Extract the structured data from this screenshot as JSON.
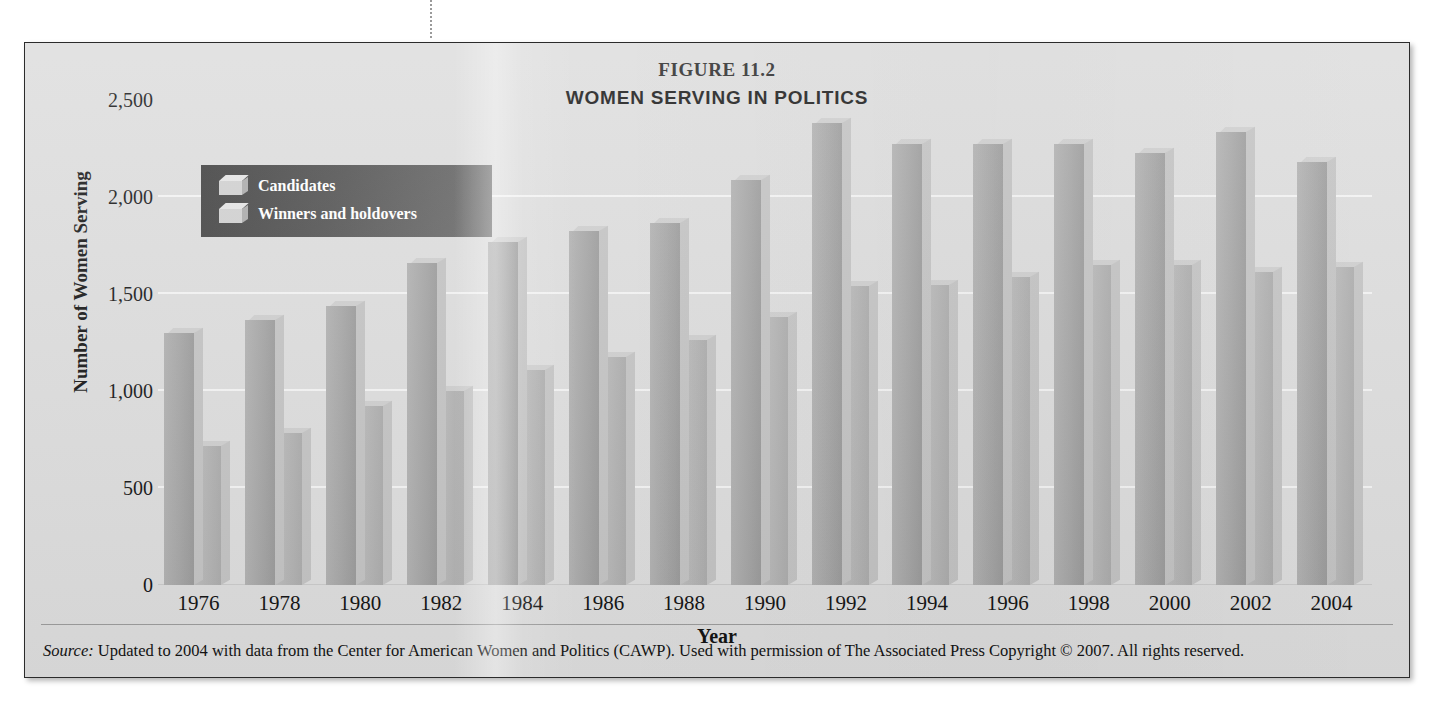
{
  "figure": {
    "number": "FIGURE 11.2",
    "title": "WOMEN SERVING IN POLITICS",
    "source_word": "Source:",
    "source_text": " Updated to 2004 with data from the Center for American Women and Politics (CAWP). Used with permission of The Associated Press Copyright © 2007. All rights reserved."
  },
  "legend": {
    "items": [
      {
        "label": "Candidates"
      },
      {
        "label": "Winners and holdovers"
      }
    ]
  },
  "colors": {
    "panel_background": "#dcdcdc",
    "panel_border": "#2b2b2b",
    "gridline": "#f3f3f3",
    "candidates_bar": "#a4a4a4",
    "winners_bar": "#b3b3b3",
    "legend_background": "#4d4d4d",
    "legend_text": "#ffffff",
    "text": "#111111"
  },
  "chart_data": {
    "type": "bar",
    "title": "WOMEN SERVING IN POLITICS",
    "subtitle": "FIGURE 11.2",
    "xlabel": "Year",
    "ylabel": "Number of Women Serving",
    "ylim": [
      0,
      2500
    ],
    "yticks": [
      "0",
      "500",
      "1,000",
      "1,500",
      "2,000",
      "2,500"
    ],
    "ytick_values": [
      0,
      500,
      1000,
      1500,
      2000,
      2500
    ],
    "grid": true,
    "legend_position": "top-left",
    "categories": [
      "1976",
      "1978",
      "1980",
      "1982",
      "1984",
      "1986",
      "1988",
      "1990",
      "1992",
      "1994",
      "1996",
      "1998",
      "2000",
      "2002",
      "2004"
    ],
    "series": [
      {
        "name": "Candidates",
        "values": [
          1300,
          1365,
          1440,
          1660,
          1770,
          1825,
          1865,
          2090,
          2380,
          2275,
          2275,
          2275,
          2225,
          2335,
          2180
        ]
      },
      {
        "name": "Winners and holdovers",
        "values": [
          715,
          785,
          925,
          1000,
          1110,
          1175,
          1265,
          1380,
          1540,
          1545,
          1590,
          1650,
          1650,
          1615,
          1640
        ]
      }
    ]
  }
}
